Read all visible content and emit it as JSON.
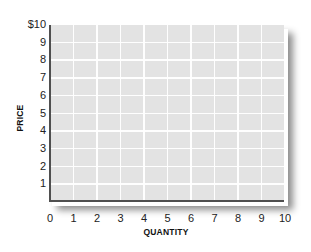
{
  "chart_data": {
    "type": "line",
    "title": "",
    "xlabel": "QUANTITY",
    "ylabel": "PRICE",
    "xlim": [
      0,
      10
    ],
    "ylim": [
      0,
      10
    ],
    "x_ticks": [
      "0",
      "1",
      "2",
      "3",
      "4",
      "5",
      "6",
      "7",
      "8",
      "9",
      "10"
    ],
    "y_ticks": [
      "1",
      "2",
      "3",
      "4",
      "5",
      "6",
      "7",
      "8",
      "9",
      "$10"
    ],
    "grid": true,
    "series": [],
    "legend": null,
    "style": {
      "plot_background": "#e3e3e3",
      "grid_color": "#ffffff",
      "axis_color": "#4f4f4f",
      "shadow": "drop shadow bottom-right"
    }
  }
}
